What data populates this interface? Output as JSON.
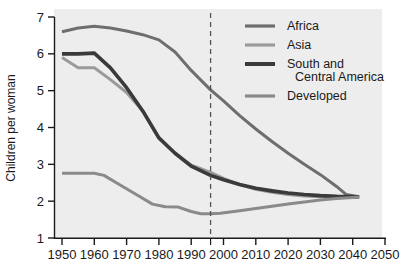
{
  "chart_data": {
    "type": "line",
    "title": "",
    "xlabel": "",
    "ylabel": "Children per woman",
    "xlim": [
      1950,
      2050
    ],
    "ylim": [
      1,
      7
    ],
    "xticks": [
      "1950",
      "1960",
      "1970",
      "1980",
      "1990",
      "2000",
      "2010",
      "2020",
      "2030",
      "2040",
      "2050"
    ],
    "yticks": [
      "1",
      "2",
      "3",
      "4",
      "5",
      "6",
      "7"
    ],
    "grid": false,
    "legend_position": "top-right",
    "annotations": [
      {
        "name": "projection-divider",
        "type": "vertical-dashed-line",
        "x": 1996,
        "label": ""
      }
    ],
    "series": [
      {
        "name": "Africa",
        "color": "#6e6e6e",
        "width": 3.0,
        "x": [
          1950,
          1955,
          1960,
          1965,
          1970,
          1975,
          1980,
          1985,
          1990,
          1996,
          2000,
          2005,
          2010,
          2015,
          2020,
          2025,
          2030,
          2035,
          2038,
          2042
        ],
        "values": [
          6.6,
          6.7,
          6.75,
          6.7,
          6.62,
          6.52,
          6.38,
          6.05,
          5.55,
          5.02,
          4.72,
          4.32,
          3.96,
          3.62,
          3.3,
          3.0,
          2.72,
          2.4,
          2.18,
          2.12
        ]
      },
      {
        "name": "Asia",
        "color": "#9a9a9a",
        "width": 3.0,
        "x": [
          1950,
          1955,
          1960,
          1965,
          1970,
          1975,
          1980,
          1985,
          1990,
          1993,
          1996,
          2000,
          2005,
          2010,
          2015,
          2020,
          2025,
          2030,
          2035,
          2040,
          2042
        ],
        "values": [
          5.9,
          5.62,
          5.62,
          5.3,
          4.95,
          4.45,
          3.7,
          3.3,
          2.98,
          2.88,
          2.78,
          2.62,
          2.45,
          2.32,
          2.24,
          2.18,
          2.14,
          2.12,
          2.11,
          2.11,
          2.11
        ]
      },
      {
        "name": "South and\nCentral America",
        "label_line1": "South and",
        "label_line2": "Central America",
        "color": "#3a3a3a",
        "width": 3.6,
        "x": [
          1950,
          1955,
          1960,
          1965,
          1970,
          1975,
          1980,
          1985,
          1990,
          1996,
          2000,
          2005,
          2010,
          2015,
          2020,
          2025,
          2030,
          2035,
          2040,
          2042
        ],
        "values": [
          6.0,
          6.0,
          6.02,
          5.62,
          5.08,
          4.45,
          3.72,
          3.3,
          2.95,
          2.7,
          2.58,
          2.45,
          2.35,
          2.28,
          2.22,
          2.18,
          2.15,
          2.13,
          2.12,
          2.12
        ]
      },
      {
        "name": "Developed",
        "color": "#8a8a8a",
        "width": 3.0,
        "x": [
          1950,
          1955,
          1960,
          1963,
          1968,
          1973,
          1978,
          1982,
          1986,
          1990,
          1993,
          1996,
          1999,
          2005,
          2010,
          2015,
          2020,
          2025,
          2030,
          2035,
          2040,
          2042
        ],
        "values": [
          2.76,
          2.76,
          2.76,
          2.7,
          2.44,
          2.18,
          1.92,
          1.85,
          1.84,
          1.72,
          1.66,
          1.66,
          1.67,
          1.74,
          1.8,
          1.86,
          1.92,
          1.98,
          2.03,
          2.07,
          2.1,
          2.11
        ]
      }
    ]
  },
  "legend": {
    "items": [
      {
        "label": "Africa"
      },
      {
        "label": "Asia"
      },
      {
        "label": "South and"
      },
      {
        "label": "Central America"
      },
      {
        "label": "Developed"
      }
    ]
  },
  "axes": {
    "y_title": "Children per woman"
  },
  "colors": {
    "plot_background": "#ededed",
    "page_background": "#ffffff",
    "axis": "#1a1a1a",
    "text": "#1a1a1a",
    "divider": "#555555"
  }
}
